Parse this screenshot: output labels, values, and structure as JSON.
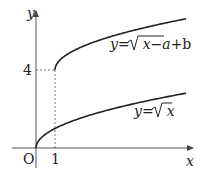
{
  "chart_data": {
    "type": "line",
    "title": "",
    "xlabel": "x",
    "ylabel": "y",
    "origin_label": "O",
    "x_ticks": [
      {
        "value": 1,
        "label": "1"
      }
    ],
    "y_ticks": [
      {
        "value": 4,
        "label": "4"
      }
    ],
    "xlim": [
      -1.5,
      8.5
    ],
    "ylim": [
      -0.8,
      7.0
    ],
    "grid": false,
    "legend": null,
    "series": [
      {
        "name": "y=√x",
        "label_text": {
          "lhs": "y",
          "eq": "=",
          "radicand": "x",
          "tail": ""
        },
        "formula": "sqrt(x)",
        "domain": [
          0,
          7.9
        ],
        "points": [
          [
            0,
            0
          ],
          [
            0.25,
            0.5
          ],
          [
            1,
            1
          ],
          [
            2,
            1.41
          ],
          [
            3,
            1.73
          ],
          [
            4,
            2
          ],
          [
            5,
            2.24
          ],
          [
            6,
            2.45
          ],
          [
            7,
            2.65
          ],
          [
            7.9,
            2.81
          ]
        ]
      },
      {
        "name": "y=√(x−a)+b",
        "label_text": {
          "lhs": "y",
          "eq": "=",
          "radicand": "x−a",
          "tail": "+b"
        },
        "formula": "sqrt(x-1)+4",
        "inferred_params": {
          "a": 1,
          "b": 4
        },
        "domain": [
          1,
          7.9
        ],
        "points": [
          [
            1,
            4
          ],
          [
            1.25,
            4.5
          ],
          [
            2,
            5
          ],
          [
            3,
            5.41
          ],
          [
            4,
            5.73
          ],
          [
            5,
            6
          ],
          [
            6,
            6.24
          ],
          [
            7,
            6.45
          ],
          [
            7.9,
            6.63
          ]
        ]
      }
    ],
    "annotations": [
      {
        "type": "dashed-guide",
        "from": [
          0,
          4
        ],
        "to": [
          1,
          4
        ]
      },
      {
        "type": "dashed-guide",
        "from": [
          1,
          0
        ],
        "to": [
          1,
          4
        ]
      }
    ]
  }
}
